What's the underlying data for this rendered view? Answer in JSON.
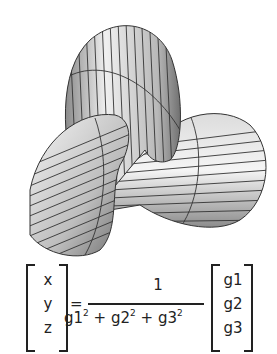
{
  "figure": {
    "colors": {
      "light": "#f2f2f2",
      "mid": "#b0b0b0",
      "dark": "#5a5a5a",
      "mesh": "#333333"
    }
  },
  "formula": {
    "lhs": [
      "x",
      "y",
      "z"
    ],
    "equals": "=",
    "numerator": "1",
    "denominator": {
      "terms": [
        {
          "base": "g1",
          "exp": "2"
        },
        {
          "base": "g2",
          "exp": "2"
        },
        {
          "base": "g3",
          "exp": "2"
        }
      ],
      "op": "+"
    },
    "rhs": [
      "g1",
      "g2",
      "g3"
    ]
  }
}
